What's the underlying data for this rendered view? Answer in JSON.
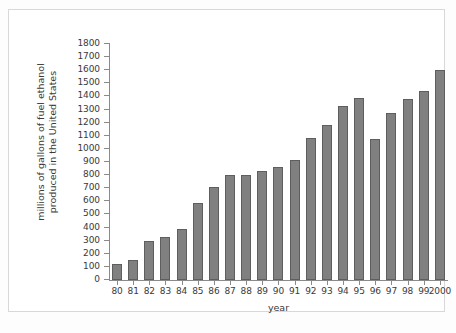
{
  "chart_data": {
    "type": "bar",
    "title": "",
    "xlabel": "year",
    "ylabel_lines": [
      "millions of gallons of fuel ethanol",
      "produced in the United States"
    ],
    "ylabel": "millions of gallons of fuel ethanol produced in the United States",
    "categories": [
      "80",
      "81",
      "82",
      "83",
      "84",
      "85",
      "86",
      "87",
      "88",
      "89",
      "90",
      "91",
      "92",
      "93",
      "94",
      "95",
      "96",
      "97",
      "98",
      "99",
      "2000"
    ],
    "values": [
      125,
      155,
      300,
      330,
      390,
      585,
      710,
      800,
      800,
      835,
      865,
      915,
      1080,
      1180,
      1330,
      1385,
      1075,
      1275,
      1380,
      1445,
      1605
    ],
    "ylim": [
      0,
      1800
    ],
    "ytick_values": [
      0,
      100,
      200,
      300,
      400,
      500,
      600,
      700,
      800,
      900,
      1000,
      1100,
      1200,
      1300,
      1400,
      1500,
      1600,
      1700,
      1800
    ],
    "ytick_labels": [
      "0",
      "100",
      "200",
      "300",
      "400",
      "500",
      "600",
      "700",
      "800",
      "900",
      "1000",
      "1100",
      "1200",
      "1300",
      "1400",
      "1500",
      "1600",
      "1700",
      "1800"
    ],
    "grid": false,
    "legend": null,
    "bar_color": "#808080",
    "bar_edge_color": "#5e5e5e",
    "axis_color": "#8a8a8a",
    "text_color": "#3a3a3a",
    "background_color": "#ffffff"
  }
}
